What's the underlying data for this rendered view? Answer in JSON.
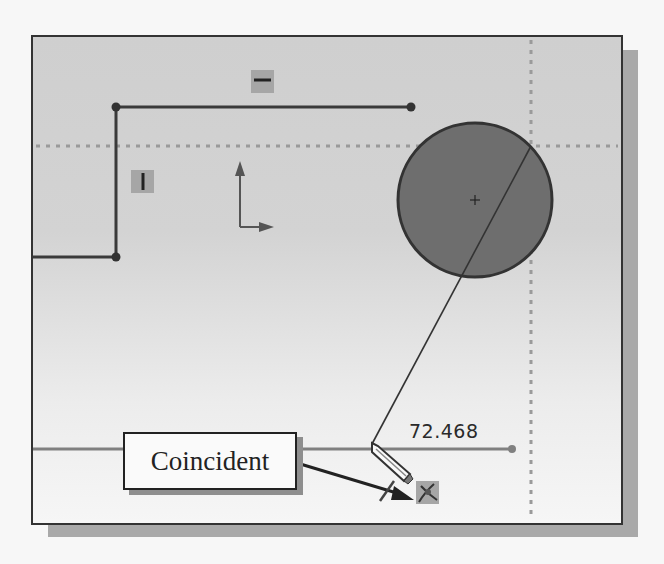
{
  "sketch": {
    "dimension_value": "72.468",
    "relations": {
      "horizontal_icon": "horizontal-relation-icon",
      "vertical_icon": "vertical-relation-icon",
      "coincident_icon": "coincident-relation-icon"
    },
    "cursor": "pencil-cursor-icon"
  },
  "callout": {
    "label": "Coincident"
  },
  "colors": {
    "sketch_line": "#3a3a3a",
    "circle_fill": "#6e6e6e",
    "inference_dots": "#9a9a9a",
    "badge_bg": "#a6a6a6"
  }
}
